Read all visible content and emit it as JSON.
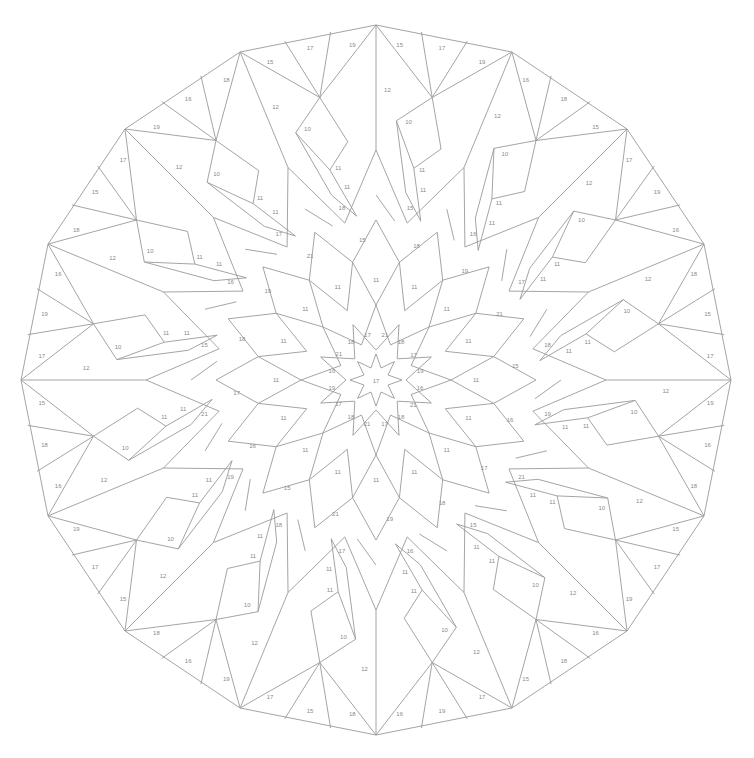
{
  "image": {
    "type": "color-by-number mandala",
    "symmetry": 16,
    "line_color": "#9a9a9a",
    "label_color": "#8a8a8a",
    "background": "#ffffff"
  },
  "labels": {
    "center": "17",
    "star_inner_ring": [
      "21",
      "18",
      "17",
      "19",
      "16",
      "21",
      "18",
      "17"
    ],
    "mid_ring": [
      "15",
      "16",
      "17",
      "18",
      "19",
      "21"
    ],
    "petal_cells": [
      "10",
      "11",
      "12",
      "13",
      "18"
    ],
    "outer_triangles": [
      "15",
      "16",
      "17",
      "18",
      "19"
    ]
  }
}
